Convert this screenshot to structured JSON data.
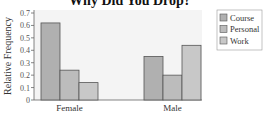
{
  "chart_data": {
    "type": "bar",
    "title": "Why Did You Drop?",
    "xlabel": "",
    "ylabel": "Relative Frequency",
    "ylim": [
      0,
      0.7
    ],
    "yticks": [
      0,
      0.1,
      0.2,
      0.3,
      0.4,
      0.5,
      0.6,
      0.7
    ],
    "ytick_labels": [
      "0",
      "0.1",
      "0.2",
      "0.3",
      "0.4",
      "0.5",
      "0.6",
      "0.7"
    ],
    "categories": [
      "Female",
      "Male"
    ],
    "series": [
      {
        "name": "Course",
        "values": [
          0.62,
          0.35
        ],
        "color": "#b0b0b0"
      },
      {
        "name": "Personal",
        "values": [
          0.24,
          0.2
        ],
        "color": "#bcbcbc"
      },
      {
        "name": "Work",
        "values": [
          0.14,
          0.44
        ],
        "color": "#c8c8c8"
      }
    ],
    "grid": false,
    "legend": "top-right",
    "plot_background": "#f4f4f4",
    "bar_edge_color": "#555555"
  }
}
